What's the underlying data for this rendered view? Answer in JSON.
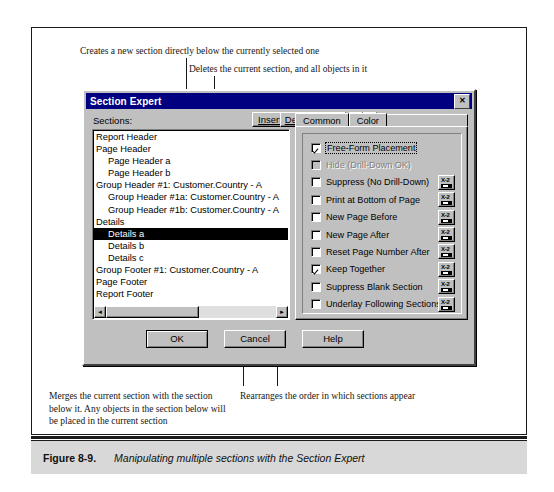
{
  "figure": {
    "number": "Figure 8-9.",
    "title": "Manipulating multiple sections with the Section Expert"
  },
  "callouts": {
    "insert": "Creates a new section directly below the currently selected one",
    "delete": "Deletes the current section, and all objects in it",
    "merge": "Merges the current section with the section below it. Any objects in the section below will be placed in the current section",
    "arrows": "Rearranges the order in which sections appear"
  },
  "dialog": {
    "title": "Section Expert",
    "close_label": "✕",
    "sections_label": "Sections:",
    "toolbar": {
      "insert": "Insert",
      "insert_accel": "I",
      "delete": "Delete",
      "delete_accel": "D",
      "merge": "Merge",
      "merge_accel": "M",
      "move_up_icon": "↑",
      "move_down_icon": "↓"
    },
    "sections": [
      {
        "label": "Report Header",
        "indent": 0,
        "selected": false
      },
      {
        "label": "Page Header",
        "indent": 0,
        "selected": false
      },
      {
        "label": "Page Header a",
        "indent": 1,
        "selected": false
      },
      {
        "label": "Page Header b",
        "indent": 1,
        "selected": false
      },
      {
        "label": "Group Header #1: Customer.Country - A",
        "indent": 0,
        "selected": false
      },
      {
        "label": "Group Header #1a: Customer.Country - A",
        "indent": 1,
        "selected": false
      },
      {
        "label": "Group Header #1b: Customer.Country - A",
        "indent": 1,
        "selected": false
      },
      {
        "label": "Details",
        "indent": 0,
        "selected": false
      },
      {
        "label": "Details a",
        "indent": 1,
        "selected": true
      },
      {
        "label": "Details b",
        "indent": 1,
        "selected": false
      },
      {
        "label": "Details c",
        "indent": 1,
        "selected": false
      },
      {
        "label": "Group Footer #1: Customer.Country - A",
        "indent": 0,
        "selected": false
      },
      {
        "label": "Page Footer",
        "indent": 0,
        "selected": false
      },
      {
        "label": "Report Footer",
        "indent": 0,
        "selected": false
      }
    ],
    "scrollbar": {
      "left_arrow": "◄",
      "right_arrow": "►"
    },
    "tabs": [
      {
        "label": "Common",
        "active": true
      },
      {
        "label": "Color",
        "active": false
      }
    ],
    "options": [
      {
        "label": "Free-Form Placement",
        "checked": true,
        "disabled": false,
        "focused": true,
        "formula": false
      },
      {
        "label": "Hide (Drill-Down OK)",
        "checked": false,
        "disabled": true,
        "focused": false,
        "formula": false
      },
      {
        "label": "Suppress (No Drill-Down)",
        "checked": false,
        "disabled": false,
        "focused": false,
        "formula": true
      },
      {
        "label": "Print at Bottom of Page",
        "checked": false,
        "disabled": false,
        "focused": false,
        "formula": true
      },
      {
        "label": "New Page Before",
        "checked": false,
        "disabled": false,
        "focused": false,
        "formula": true
      },
      {
        "label": "New Page After",
        "checked": false,
        "disabled": false,
        "focused": false,
        "formula": true
      },
      {
        "label": "Reset Page Number After",
        "checked": false,
        "disabled": false,
        "focused": false,
        "formula": true
      },
      {
        "label": "Keep Together",
        "checked": true,
        "disabled": false,
        "focused": false,
        "formula": true
      },
      {
        "label": "Suppress Blank Section",
        "checked": false,
        "disabled": false,
        "focused": false,
        "formula": true
      },
      {
        "label": "Underlay Following Sections",
        "checked": false,
        "disabled": false,
        "focused": false,
        "formula": true
      }
    ],
    "formula_button_label": "X-2",
    "buttons": {
      "ok": "OK",
      "cancel": "Cancel",
      "help": "Help"
    }
  },
  "colors": {
    "titlebar": "#000080",
    "dialog_face": "#c0c0c0",
    "selection": "#000000",
    "caption_bg": "#d8d8d8"
  }
}
